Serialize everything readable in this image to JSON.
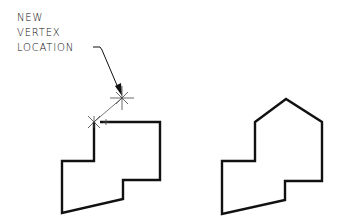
{
  "annotation": {
    "lines": [
      "NEW",
      "VERTEX",
      "LOCATION"
    ]
  },
  "figures": [
    {
      "name": "before",
      "description": "Polygon with new vertex being added via grip"
    },
    {
      "name": "after",
      "description": "Polygon with added peak vertex"
    }
  ],
  "colors": {
    "stroke": "#111111",
    "background": "#ffffff"
  }
}
